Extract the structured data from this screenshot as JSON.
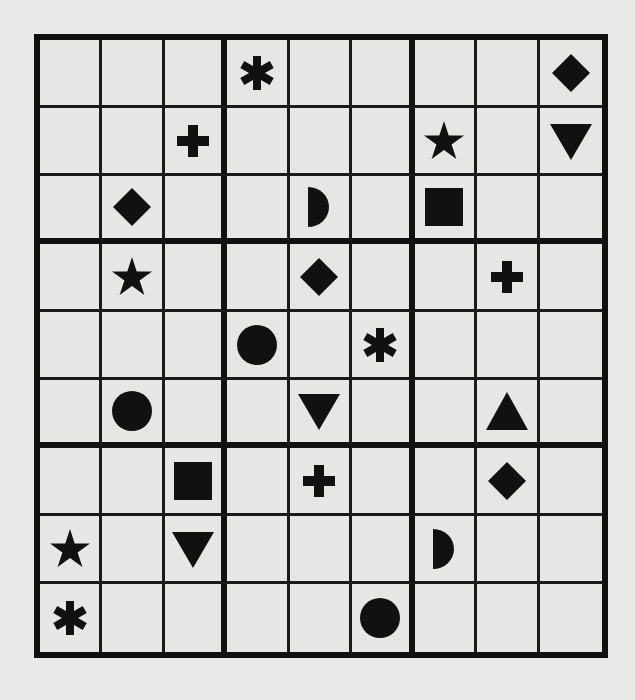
{
  "puzzle": {
    "type": "symbol-sudoku",
    "size": 9,
    "box_size": 3,
    "symbols": [
      "asterisk",
      "plus",
      "diamond",
      "star",
      "down-triangle",
      "up-triangle",
      "half-circle",
      "square",
      "circle"
    ],
    "colors": {
      "ink": "#111111",
      "paper": "#e6e6e4"
    },
    "grid": [
      [
        "",
        "",
        "",
        "asterisk",
        "",
        "",
        "",
        "",
        "diamond"
      ],
      [
        "",
        "",
        "plus",
        "",
        "",
        "",
        "star",
        "",
        "down-triangle"
      ],
      [
        "",
        "diamond",
        "",
        "",
        "half-circle",
        "",
        "square",
        "",
        ""
      ],
      [
        "",
        "star",
        "",
        "",
        "diamond",
        "",
        "",
        "plus",
        ""
      ],
      [
        "",
        "",
        "",
        "circle",
        "",
        "asterisk",
        "",
        "",
        ""
      ],
      [
        "",
        "circle",
        "",
        "",
        "down-triangle",
        "",
        "",
        "up-triangle",
        ""
      ],
      [
        "",
        "",
        "square",
        "",
        "plus",
        "",
        "",
        "diamond",
        ""
      ],
      [
        "star",
        "",
        "down-triangle",
        "",
        "",
        "",
        "half-circle",
        "",
        ""
      ],
      [
        "asterisk",
        "",
        "",
        "",
        "",
        "circle",
        "",
        "",
        ""
      ]
    ]
  }
}
